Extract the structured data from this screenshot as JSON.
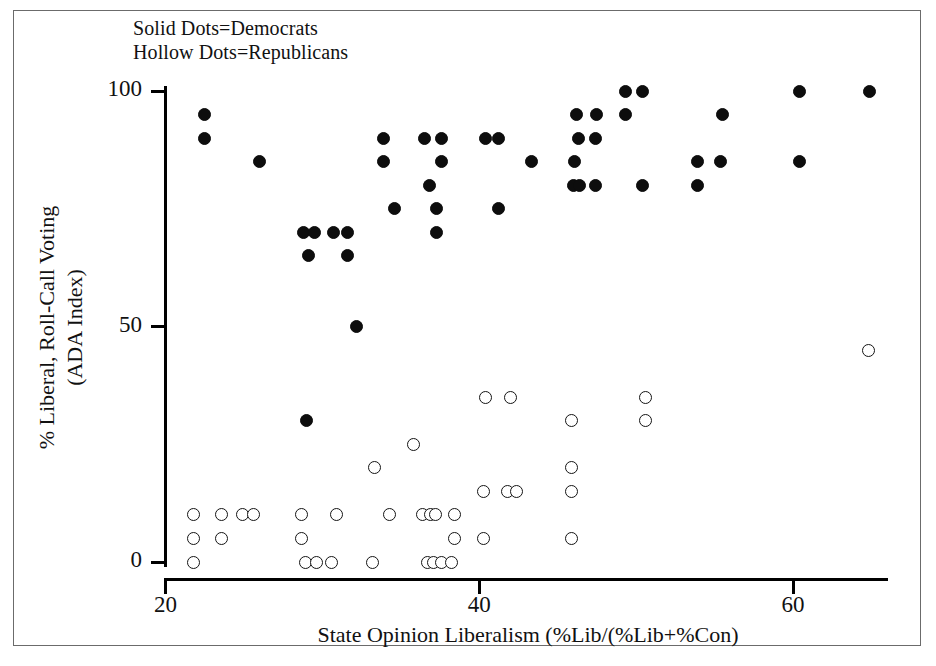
{
  "legend": {
    "line1": "Solid Dots=Democrats",
    "line2": "Hollow Dots=Republicans",
    "solid_meaning": "Democrats",
    "hollow_meaning": "Republicans"
  },
  "axes": {
    "x_label": "State Opinion Liberalism (%Lib/(%Lib+%Con)",
    "y_label_line1": "% Liberal, Roll-Call Voting",
    "y_label_line2": "(ADA Index)",
    "x_ticks": [
      "20",
      "40",
      "60"
    ],
    "y_ticks": [
      "0",
      "50",
      "100"
    ]
  },
  "colors": {
    "solid_dot": "#0d0d0d",
    "hollow_dot_stroke": "#141414",
    "hollow_dot_fill": "#ffffff",
    "axis": "#000000",
    "frame": "#6b6b6b",
    "background": "#ffffff"
  },
  "chart_data": {
    "type": "scatter",
    "title": "",
    "xlabel": "State Opinion Liberalism (%Lib/(%Lib+%Con)",
    "ylabel": "% Liberal, Roll-Call Voting (ADA Index)",
    "xlim": [
      19.0,
      66.5
    ],
    "ylim": [
      -3,
      104
    ],
    "xticks": [
      20,
      40,
      60
    ],
    "yticks": [
      0,
      50,
      100
    ],
    "grid": false,
    "legend_position": "top-left",
    "series": [
      {
        "name": "Democrats",
        "marker": "solid-circle",
        "color": "#0d0d0d",
        "points": [
          [
            22.5,
            95
          ],
          [
            22.5,
            90
          ],
          [
            26.0,
            85
          ],
          [
            28.8,
            70
          ],
          [
            29.5,
            70
          ],
          [
            30.7,
            70
          ],
          [
            31.6,
            70
          ],
          [
            29.1,
            65
          ],
          [
            31.6,
            65
          ],
          [
            32.2,
            50
          ],
          [
            29.0,
            30
          ],
          [
            33.9,
            90
          ],
          [
            33.9,
            85
          ],
          [
            36.5,
            90
          ],
          [
            37.6,
            90
          ],
          [
            37.6,
            85
          ],
          [
            36.8,
            80
          ],
          [
            34.6,
            75
          ],
          [
            37.3,
            75
          ],
          [
            37.3,
            70
          ],
          [
            40.4,
            90
          ],
          [
            41.2,
            90
          ],
          [
            41.2,
            75
          ],
          [
            43.3,
            85
          ],
          [
            46.2,
            95
          ],
          [
            47.5,
            95
          ],
          [
            46.3,
            90
          ],
          [
            47.4,
            90
          ],
          [
            46.1,
            85
          ],
          [
            46.0,
            80
          ],
          [
            46.4,
            80
          ],
          [
            47.4,
            80
          ],
          [
            49.3,
            100
          ],
          [
            50.4,
            100
          ],
          [
            49.3,
            95
          ],
          [
            50.4,
            80
          ],
          [
            53.9,
            85
          ],
          [
            53.9,
            80
          ],
          [
            55.5,
            95
          ],
          [
            55.4,
            85
          ],
          [
            60.4,
            100
          ],
          [
            60.4,
            85
          ],
          [
            64.9,
            100
          ]
        ]
      },
      {
        "name": "Republicans",
        "marker": "hollow-circle",
        "color": "#141414",
        "points": [
          [
            21.8,
            10
          ],
          [
            21.8,
            5
          ],
          [
            21.8,
            0
          ],
          [
            23.6,
            10
          ],
          [
            23.6,
            5
          ],
          [
            24.9,
            10
          ],
          [
            25.6,
            10
          ],
          [
            28.7,
            10
          ],
          [
            28.7,
            5
          ],
          [
            28.9,
            0
          ],
          [
            29.6,
            0
          ],
          [
            30.6,
            0
          ],
          [
            30.9,
            10
          ],
          [
            33.3,
            20
          ],
          [
            33.2,
            0
          ],
          [
            34.3,
            10
          ],
          [
            35.8,
            25
          ],
          [
            36.4,
            10
          ],
          [
            36.9,
            10
          ],
          [
            37.2,
            10
          ],
          [
            36.7,
            0
          ],
          [
            37.1,
            0
          ],
          [
            37.6,
            0
          ],
          [
            38.2,
            0
          ],
          [
            38.4,
            10
          ],
          [
            38.4,
            5
          ],
          [
            40.4,
            35
          ],
          [
            40.3,
            15
          ],
          [
            40.3,
            5
          ],
          [
            42.0,
            35
          ],
          [
            41.8,
            15
          ],
          [
            42.4,
            15
          ],
          [
            45.9,
            30
          ],
          [
            45.9,
            20
          ],
          [
            45.9,
            15
          ],
          [
            45.9,
            5
          ],
          [
            50.6,
            35
          ],
          [
            50.6,
            30
          ],
          [
            64.8,
            45
          ]
        ]
      }
    ]
  }
}
